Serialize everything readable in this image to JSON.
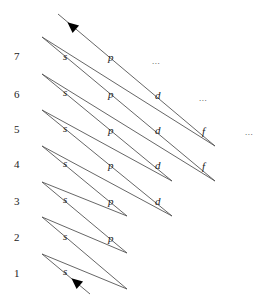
{
  "diagram": {
    "row_labels": [
      {
        "n": "7",
        "x": 14,
        "y": 60
      },
      {
        "n": "6",
        "x": 14,
        "y": 98
      },
      {
        "n": "5",
        "x": 14,
        "y": 133
      },
      {
        "n": "4",
        "x": 14,
        "y": 168
      },
      {
        "n": "3",
        "x": 14,
        "y": 205
      },
      {
        "n": "2",
        "x": 14,
        "y": 241
      },
      {
        "n": "1",
        "x": 14,
        "y": 277
      }
    ],
    "orbitals": [
      {
        "label": "s",
        "n": 1,
        "x": 63,
        "y": 275
      },
      {
        "label": "s",
        "n": 2,
        "x": 63,
        "y": 240
      },
      {
        "label": "p",
        "n": 2,
        "x": 108,
        "y": 242
      },
      {
        "label": "s",
        "n": 3,
        "x": 63,
        "y": 203
      },
      {
        "label": "p",
        "n": 3,
        "x": 108,
        "y": 205
      },
      {
        "label": "d",
        "n": 3,
        "x": 155,
        "y": 205
      },
      {
        "label": "s",
        "n": 4,
        "x": 63,
        "y": 167
      },
      {
        "label": "p",
        "n": 4,
        "x": 108,
        "y": 169
      },
      {
        "label": "d",
        "n": 4,
        "x": 155,
        "y": 169
      },
      {
        "label": "f",
        "n": 4,
        "x": 202,
        "y": 170
      },
      {
        "label": "s",
        "n": 5,
        "x": 63,
        "y": 132
      },
      {
        "label": "p",
        "n": 5,
        "x": 108,
        "y": 134
      },
      {
        "label": "d",
        "n": 5,
        "x": 155,
        "y": 134
      },
      {
        "label": "f",
        "n": 5,
        "x": 202,
        "y": 135
      },
      {
        "label": "s",
        "n": 6,
        "x": 63,
        "y": 96
      },
      {
        "label": "p",
        "n": 6,
        "x": 108,
        "y": 98
      },
      {
        "label": "d",
        "n": 6,
        "x": 155,
        "y": 99
      },
      {
        "label": "s",
        "n": 7,
        "x": 63,
        "y": 60
      },
      {
        "label": "p",
        "n": 7,
        "x": 108,
        "y": 61
      }
    ],
    "ellipses": [
      {
        "text": "...",
        "row": 7,
        "x": 152,
        "y": 64
      },
      {
        "text": "...",
        "row": 6,
        "x": 199,
        "y": 101
      },
      {
        "text": "...",
        "row": 5,
        "x": 245,
        "y": 135
      }
    ],
    "path_points": [
      [
        90,
        294
      ],
      [
        42,
        254
      ],
      [
        127,
        289
      ],
      [
        42,
        217
      ],
      [
        127,
        253
      ],
      [
        42,
        182
      ],
      [
        127,
        216
      ],
      [
        42,
        146
      ],
      [
        172,
        216
      ],
      [
        42,
        110
      ],
      [
        172,
        181
      ],
      [
        42,
        74
      ],
      [
        215,
        181
      ],
      [
        42,
        37
      ],
      [
        215,
        146
      ],
      [
        58,
        14
      ]
    ],
    "arrows": [
      {
        "x": 76,
        "y": 282,
        "angle": -140
      },
      {
        "x": 72,
        "y": 26,
        "angle": -140
      }
    ],
    "filling_order": [
      "1s",
      "2s",
      "2p",
      "3s",
      "3p",
      "4s",
      "3d",
      "4p",
      "5s",
      "4d",
      "5p",
      "6s",
      "4f",
      "5d",
      "6p",
      "7s",
      "5f",
      "6d",
      "7p"
    ],
    "colors": {
      "line": "#555555",
      "text": "#222222"
    }
  }
}
